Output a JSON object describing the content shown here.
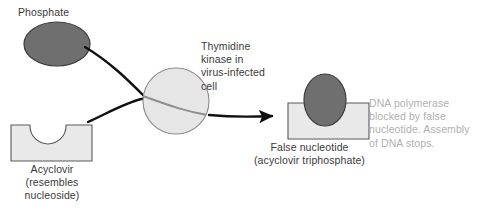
{
  "figure": {
    "background_color": "#ffffff",
    "width": 482,
    "height": 215
  },
  "labels": {
    "phosphate": "Phosphate",
    "acyclovir": "Acyclovir\n(resembles\nnucleoside)",
    "thymidine_kinase": "Thymidine\nkinase in\nvirus-infected\ncell",
    "false_nucleotide": "False nucleotide\n(acyclovir triphosphate)",
    "dna_polymerase": "DNA polymerase\nblocked by false\nnucleotide. Assembly\nof DNA stops."
  },
  "shapes": {
    "phosphate_ellipse": {
      "name": "phosphate",
      "type": "ellipse",
      "cx": 57,
      "cy": 44,
      "rx": 33,
      "ry": 22,
      "fill": "#6f6f6f",
      "stroke": "#3c3c3c"
    },
    "acyclovir_block": {
      "name": "acyclovir",
      "type": "notched-rectangle",
      "x": 11,
      "y": 125,
      "width": 81,
      "height": 36,
      "notch_cx": 48,
      "notch_r": 18,
      "fill": "#e9e9e9",
      "stroke": "#5a5a5a"
    },
    "kinase_circle": {
      "name": "thymidine-kinase",
      "type": "circle",
      "cx": 176,
      "cy": 101,
      "r": 33,
      "fill": "#e6e6e6",
      "stroke": "#8c8c8c"
    },
    "false_nucleotide_block": {
      "name": "false-nucleotide",
      "type": "notched-rectangle",
      "x": 288,
      "y": 103,
      "width": 81,
      "height": 36,
      "notch_cx": 325,
      "notch_r": 18,
      "fill": "#e9e9e9",
      "stroke": "#5a5a5a"
    },
    "false_nucleotide_ellipse": {
      "name": "bound-phosphate",
      "type": "ellipse",
      "cx": 325,
      "cy": 100,
      "rx": 21,
      "ry": 26,
      "fill": "#6f6f6f",
      "stroke": "#3c3c3c"
    }
  },
  "connectors": {
    "phosphate_to_kinase": {
      "name": "phosphate-to-kinase-curve",
      "path": "M 85 47 C 110 62 128 80 145 97",
      "stroke": "#111111",
      "width": 2.4
    },
    "acyclovir_to_kinase": {
      "name": "acyclovir-to-kinase-curve",
      "path": "M 88 122 C 108 113 128 101 146 98",
      "stroke": "#111111",
      "width": 2.4
    },
    "kinase_internal": {
      "name": "kinase-internal-curve",
      "path": "M 145 97 C 165 104 186 112 209 115",
      "stroke": "#8c8c8c",
      "width": 2.0
    },
    "kinase_to_nucleotide": {
      "name": "kinase-to-nucleotide-arrow",
      "path": "M 209 115 C 230 117 252 117 276 116",
      "stroke": "#111111",
      "width": 2.4,
      "arrowhead": true
    }
  },
  "colors": {
    "text_primary": "#3a3a3a",
    "text_muted": "#b0b0b0",
    "line_dark": "#111111",
    "line_gray": "#8c8c8c",
    "fill_light": "#e9e9e9",
    "fill_dark": "#6f6f6f"
  }
}
